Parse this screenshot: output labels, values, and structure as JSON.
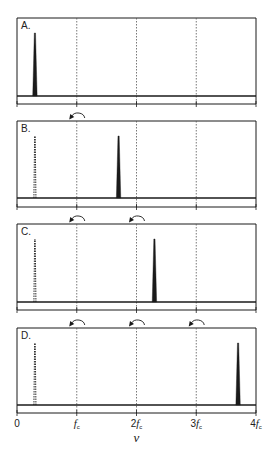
{
  "figure": {
    "x_axis": {
      "label": "ν",
      "ticks": [
        {
          "pos": 0,
          "main": "0",
          "sub": ""
        },
        {
          "pos": 1,
          "main": "f",
          "sub": "c"
        },
        {
          "pos": 2,
          "main": "2f",
          "sub": "c"
        },
        {
          "pos": 3,
          "main": "3f",
          "sub": "c"
        },
        {
          "pos": 4,
          "main": "4f",
          "sub": "c"
        }
      ],
      "range": [
        0,
        4
      ],
      "unit": "f_c"
    },
    "dashed_guides_at": [
      1,
      2,
      3
    ],
    "panels": [
      {
        "label": "A.",
        "solid_peak": 0.3,
        "aliased_peak": null,
        "fold_arrows_at": []
      },
      {
        "label": "B.",
        "solid_peak": 1.7,
        "aliased_peak": 0.3,
        "fold_arrows_at": [
          1
        ]
      },
      {
        "label": "C.",
        "solid_peak": 2.3,
        "aliased_peak": 0.3,
        "fold_arrows_at": [
          1,
          2
        ]
      },
      {
        "label": "D.",
        "solid_peak": 3.7,
        "aliased_peak": 0.3,
        "fold_arrows_at": [
          1,
          2,
          3
        ]
      }
    ],
    "colors": {
      "line": "#1a1a1a",
      "guide": "#555555",
      "background": "#ffffff"
    }
  }
}
